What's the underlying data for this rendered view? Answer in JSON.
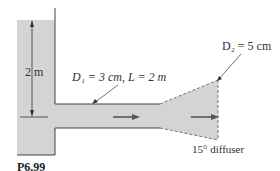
{
  "figure": {
    "caption": "P6.99",
    "labels": {
      "height": "2 m",
      "pipe": "D₁ = 3 cm, L = 2 m",
      "outlet": "D₂ = 5 cm",
      "diffuser": "15° diffuser"
    },
    "colors": {
      "fluid": "#d4d4d4",
      "lines": "#444444",
      "arrow": "#555555"
    }
  }
}
